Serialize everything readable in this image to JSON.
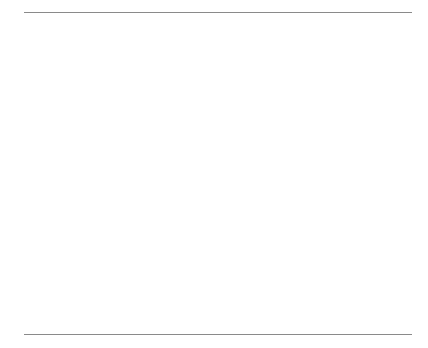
{
  "figure": {
    "clipped_title_fragment": "",
    "top_rule": true,
    "bottom_rule": true
  },
  "chart_data": [
    {
      "type": "line",
      "panel": "top",
      "title": "",
      "xlabel": "",
      "ylabel": "Black-White Ratio",
      "xlim": [
        1968,
        2001
      ],
      "ylim": [
        1.6,
        4.15
      ],
      "ytick_labels": [
        "2.0",
        "2.5",
        "3.0",
        "3.5",
        "4.0"
      ],
      "yticks": [
        2.0,
        2.5,
        3.0,
        3.5,
        4.0
      ],
      "xtick_labels": [
        "1970",
        "1975",
        "1980",
        "1985",
        "1990",
        "1995",
        "2000"
      ],
      "xticks": [
        1970,
        1975,
        1980,
        1985,
        1990,
        1995,
        2000
      ],
      "grid": false,
      "legend": "none",
      "series": [
        {
          "name": "Black-White Ratio",
          "x": [
            1968,
            1969,
            1970,
            1971,
            1972,
            1973,
            1974,
            1975,
            1976,
            1977,
            1978,
            1979,
            1980,
            1981,
            1982,
            1983,
            1984,
            1985,
            1986,
            1987,
            1988,
            1989,
            1990,
            1991,
            1992,
            1993,
            1994,
            1995,
            1996,
            1997,
            1998,
            1999,
            2000,
            2001
          ],
          "values": [
            2.2,
            2.05,
            2.0,
            2.05,
            1.98,
            1.88,
            1.8,
            1.75,
            2.1,
            2.1,
            2.08,
            2.0,
            2.1,
            2.15,
            2.25,
            2.45,
            2.65,
            2.7,
            2.68,
            2.72,
            3.1,
            3.25,
            3.55,
            4.05,
            3.82,
            3.78,
            3.7,
            3.78,
            3.5,
            3.25,
            3.28,
            3.22,
            3.05,
            2.65
          ]
        }
      ]
    },
    {
      "type": "line",
      "panel": "bottom",
      "title": "",
      "xlabel": "",
      "ylabel": "Drug Arrest Rate per 100,000",
      "xlim": [
        1968,
        2001
      ],
      "ylim": [
        0,
        1600
      ],
      "ytick_labels": [
        "0",
        "500",
        "1000",
        "1500"
      ],
      "yticks": [
        0,
        500,
        1000,
        1500
      ],
      "xtick_labels": [
        "1970",
        "1975",
        "1980",
        "1985",
        "1990",
        "1995",
        "2000"
      ],
      "xticks": [
        1970,
        1975,
        1980,
        1985,
        1990,
        1995,
        2000
      ],
      "grid": false,
      "legend_position": "top-left",
      "series": [
        {
          "name": "Blacks",
          "marker": "filled-circle",
          "linestyle": "dashed",
          "x": [
            1968,
            1969,
            1970,
            1971,
            1972,
            1973,
            1974,
            1975,
            1976,
            1977,
            1978,
            1979,
            1980,
            1981,
            1982,
            1983,
            1984,
            1985,
            1986,
            1987,
            1988,
            1989,
            1990,
            1991,
            1992,
            1993,
            1994,
            1995,
            1996,
            1997,
            1998,
            1999,
            2000,
            2001
          ],
          "values": [
            300,
            330,
            410,
            470,
            490,
            610,
            530,
            560,
            545,
            500,
            475,
            525,
            580,
            620,
            640,
            660,
            700,
            760,
            860,
            950,
            1180,
            1500,
            1250,
            1060,
            1150,
            1120,
            1200,
            1330,
            1270,
            1400,
            1470,
            1500,
            1350,
            1170
          ]
        },
        {
          "name": "Whites",
          "marker": "open-circle",
          "linestyle": "dashed",
          "x": [
            1968,
            1969,
            1970,
            1971,
            1972,
            1973,
            1974,
            1975,
            1976,
            1977,
            1978,
            1979,
            1980,
            1981,
            1982,
            1983,
            1984,
            1985,
            1986,
            1987,
            1988,
            1989,
            1990,
            1991,
            1992,
            1993,
            1994,
            1995,
            1996,
            1997,
            1998,
            1999,
            2000,
            2001
          ],
          "values": [
            135,
            160,
            205,
            230,
            245,
            325,
            295,
            265,
            260,
            240,
            230,
            260,
            275,
            288,
            285,
            270,
            265,
            282,
            320,
            350,
            380,
            395,
            352,
            262,
            300,
            296,
            324,
            352,
            363,
            430,
            448,
            466,
            443,
            442
          ]
        }
      ]
    }
  ],
  "legend": {
    "items": [
      {
        "label": "Blacks",
        "marker": "filled-circle"
      },
      {
        "label": "Whites",
        "marker": "open-circle"
      }
    ]
  }
}
